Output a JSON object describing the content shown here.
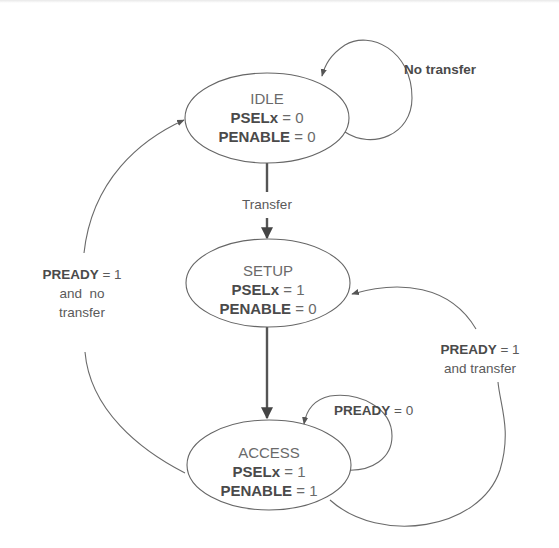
{
  "diagram": {
    "type": "state-machine",
    "colors": {
      "stroke": "#666666",
      "text": "#4a4a4a",
      "background": "#ffffff"
    },
    "states": [
      {
        "id": "idle",
        "name": "IDLE",
        "signals": [
          {
            "name": "PSELx",
            "op": "=",
            "value": "0"
          },
          {
            "name": "PENABLE",
            "op": "=",
            "value": "0"
          }
        ]
      },
      {
        "id": "setup",
        "name": "SETUP",
        "signals": [
          {
            "name": "PSELx",
            "op": "=",
            "value": "1"
          },
          {
            "name": "PENABLE",
            "op": "=",
            "value": "0"
          }
        ]
      },
      {
        "id": "access",
        "name": "ACCESS",
        "signals": [
          {
            "name": "PSELx",
            "op": "=",
            "value": "1"
          },
          {
            "name": "PENABLE",
            "op": "=",
            "value": "1"
          }
        ]
      }
    ],
    "transitions": [
      {
        "from": "idle",
        "to": "idle",
        "label": "No transfer"
      },
      {
        "from": "idle",
        "to": "setup",
        "label": "Transfer"
      },
      {
        "from": "setup",
        "to": "access",
        "label": ""
      },
      {
        "from": "access",
        "to": "access",
        "label_bold": "PREADY",
        "label_rest": " = 0"
      },
      {
        "from": "access",
        "to": "setup",
        "label_bold": "PREADY",
        "label_rest": " = 1",
        "label_line2": "and transfer"
      },
      {
        "from": "access",
        "to": "idle",
        "label_bold": "PREADY",
        "label_rest": " = 1",
        "label_line2": "and  no",
        "label_line3": "transfer"
      }
    ]
  }
}
